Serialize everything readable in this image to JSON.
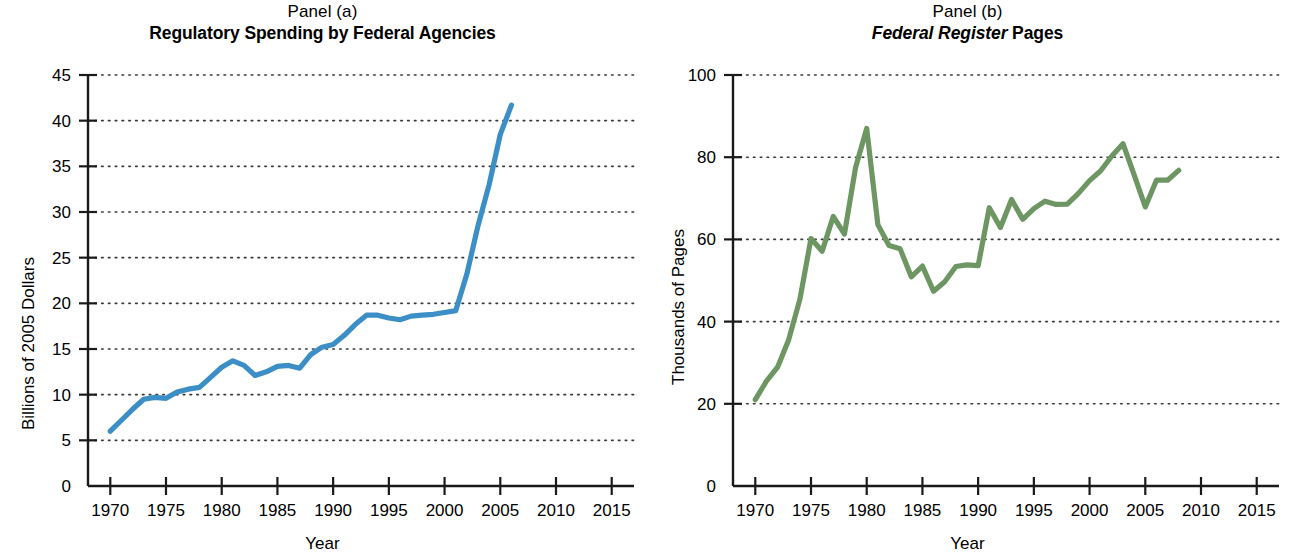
{
  "figure": {
    "background": "#ffffff",
    "axis_color": "#1a1a1a",
    "grid_color": "#3a3a3a"
  },
  "panels": [
    {
      "id": "a",
      "panel_label": "Panel (a)",
      "title_plain": "Regulatory Spending by Federal Agencies",
      "title_italic_part": "",
      "title_tail": "",
      "ylabel": "Billions of 2005 Dollars",
      "xlabel": "Year",
      "line_color": "#3c8ec6"
    },
    {
      "id": "b",
      "panel_label": "Panel (b)",
      "title_plain": "",
      "title_italic_part": "Federal Register",
      "title_tail": " Pages",
      "ylabel": "Thousands of Pages",
      "xlabel": "Year",
      "line_color": "#6d9663"
    }
  ],
  "chart_data": [
    {
      "type": "line",
      "title": "Regulatory Spending by Federal Agencies",
      "panel": "Panel (a)",
      "xlabel": "Year",
      "ylabel": "Billions of 2005 Dollars",
      "xlim": [
        1968,
        2017
      ],
      "ylim": [
        0,
        45
      ],
      "xticks": [
        1970,
        1975,
        1980,
        1985,
        1990,
        1995,
        2000,
        2005,
        2010,
        2015
      ],
      "yticks": [
        0,
        5,
        10,
        15,
        20,
        25,
        30,
        35,
        40,
        45
      ],
      "grid": "horizontal-dotted",
      "legend": null,
      "color": "#3c8ec6",
      "x": [
        1970,
        1971,
        1972,
        1973,
        1974,
        1975,
        1976,
        1977,
        1978,
        1979,
        1980,
        1981,
        1982,
        1983,
        1984,
        1985,
        1986,
        1987,
        1988,
        1989,
        1990,
        1991,
        1992,
        1993,
        1994,
        1995,
        1996,
        1997,
        1998,
        1999,
        2000,
        2001,
        2002,
        2003,
        2004,
        2005,
        2006
      ],
      "values": [
        6.0,
        7.2,
        8.4,
        9.5,
        9.7,
        9.6,
        10.3,
        10.6,
        10.8,
        11.9,
        13.0,
        13.7,
        13.2,
        12.1,
        12.5,
        13.1,
        13.2,
        12.9,
        14.4,
        15.2,
        15.5,
        16.5,
        17.7,
        18.7,
        18.7,
        18.4,
        18.2,
        18.6,
        18.7,
        18.8,
        19.0,
        19.2,
        23.2,
        28.5,
        33.0,
        38.5,
        41.7
      ]
    },
    {
      "type": "line",
      "title": "Federal Register Pages",
      "panel": "Panel (b)",
      "xlabel": "Year",
      "ylabel": "Thousands of Pages",
      "xlim": [
        1968,
        2017
      ],
      "ylim": [
        0,
        100
      ],
      "xticks": [
        1970,
        1975,
        1980,
        1985,
        1990,
        1995,
        2000,
        2005,
        2010,
        2015
      ],
      "yticks": [
        0,
        20,
        40,
        60,
        80,
        100
      ],
      "grid": "horizontal-dotted",
      "legend": null,
      "color": "#6d9663",
      "x": [
        1970,
        1971,
        1972,
        1973,
        1974,
        1975,
        1976,
        1977,
        1978,
        1979,
        1980,
        1981,
        1982,
        1983,
        1984,
        1985,
        1986,
        1987,
        1988,
        1989,
        1990,
        1991,
        1992,
        1993,
        1994,
        1995,
        1996,
        1997,
        1998,
        1999,
        2000,
        2001,
        2002,
        2003,
        2004,
        2005,
        2006,
        2007,
        2008
      ],
      "values": [
        21.0,
        25.5,
        28.9,
        35.6,
        45.4,
        60.2,
        57.1,
        65.6,
        61.3,
        77.5,
        87.0,
        63.6,
        58.5,
        57.7,
        50.9,
        53.5,
        47.4,
        49.7,
        53.4,
        53.8,
        53.6,
        67.7,
        62.9,
        69.7,
        64.9,
        67.5,
        69.3,
        68.5,
        68.6,
        71.2,
        74.3,
        76.7,
        80.3,
        83.3,
        75.7,
        67.9,
        74.4,
        74.4,
        76.8
      ]
    }
  ]
}
